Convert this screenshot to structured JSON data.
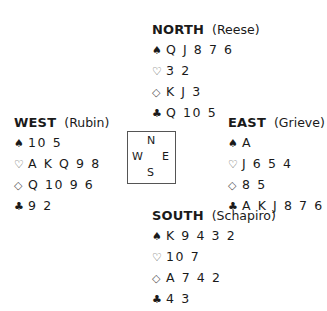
{
  "north": {
    "seat": "NORTH",
    "player": "(Reese)",
    "spades": "Q J 8 7 6",
    "hearts": "3 2",
    "diamonds": "K J 3",
    "clubs": "Q 10 5"
  },
  "west": {
    "seat": "WEST",
    "player": "(Rubin)",
    "spades": "10 5",
    "hearts": "A K Q 9 8",
    "diamonds": "Q 10 9 6",
    "clubs": "9 2"
  },
  "east": {
    "seat": "EAST",
    "player": "(Grieve)",
    "spades": "A",
    "hearts": "J 6 5 4",
    "diamonds": "8 5",
    "clubs": "A K J 8 7 6"
  },
  "south": {
    "seat": "SOUTH",
    "player": "(Schapiro)",
    "spades": "K 9 4 3 2",
    "hearts": "10 7",
    "diamonds": "A 7 4 2",
    "clubs": "4 3"
  },
  "compass": {
    "n": "N",
    "w": "W",
    "e": "E",
    "s": "S"
  },
  "symbols": {
    "spades": "♠",
    "hearts": "♡",
    "diamonds": "◇",
    "clubs": "♣"
  }
}
